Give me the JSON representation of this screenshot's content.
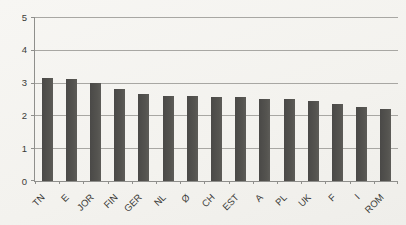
{
  "chart_data": {
    "type": "bar",
    "categories": [
      "TN",
      "E",
      "JOR",
      "FIN",
      "GER",
      "NL",
      "Ø",
      "CH",
      "EST",
      "A",
      "PL",
      "UK",
      "F",
      "I",
      "ROM"
    ],
    "values": [
      3.15,
      3.1,
      3.0,
      2.8,
      2.65,
      2.6,
      2.6,
      2.55,
      2.55,
      2.5,
      2.5,
      2.45,
      2.35,
      2.25,
      2.2
    ],
    "title": "",
    "xlabel": "",
    "ylabel": "",
    "ylim": [
      0,
      5
    ],
    "yticks": [
      0,
      1,
      2,
      3,
      4,
      5
    ],
    "grid": "horizontal",
    "legend": "none",
    "colors": {
      "bar": "#4f4e4b",
      "gridline": "#a8a7a3",
      "axis": "#8f8f8c",
      "label": "#3b3b38",
      "background": "#f4f3ef"
    }
  }
}
